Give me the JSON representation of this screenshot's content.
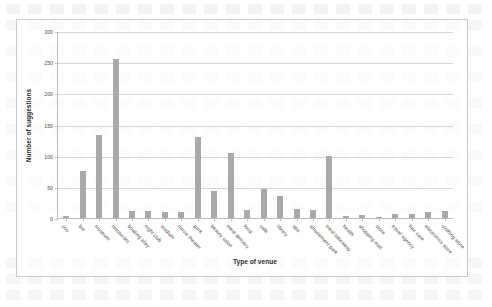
{
  "chart_data": {
    "type": "bar",
    "title": "",
    "xlabel": "Type of venue",
    "ylabel": "Number of suggestions",
    "ylim": [
      0,
      300
    ],
    "yticks": [
      0,
      50,
      100,
      150,
      200,
      250,
      300
    ],
    "grid": true,
    "legend": false,
    "bar_color": "#a9a9a9",
    "categories": [
      "zoo",
      "bar",
      "museum",
      "restaurant",
      "bowling alley",
      "night club",
      "stadium",
      "movie theater",
      "park",
      "beauty salon",
      "meal delivery",
      "food",
      "cafe",
      "library",
      "spa",
      "amusement park",
      "meal takeaway",
      "health",
      "shopping mall",
      "store",
      "travel agency",
      "hair care",
      "electronics store",
      "clothing store"
    ],
    "values": [
      3,
      75,
      133,
      255,
      12,
      12,
      9,
      10,
      130,
      43,
      105,
      13,
      47,
      36,
      14,
      13,
      100,
      4,
      5,
      2,
      6,
      7,
      9,
      11
    ]
  },
  "axes": {
    "y_title": "Number of suggestions",
    "x_title": "Type of venue",
    "y_tick_labels": [
      "0",
      "50",
      "100",
      "150",
      "200",
      "250",
      "300"
    ]
  }
}
